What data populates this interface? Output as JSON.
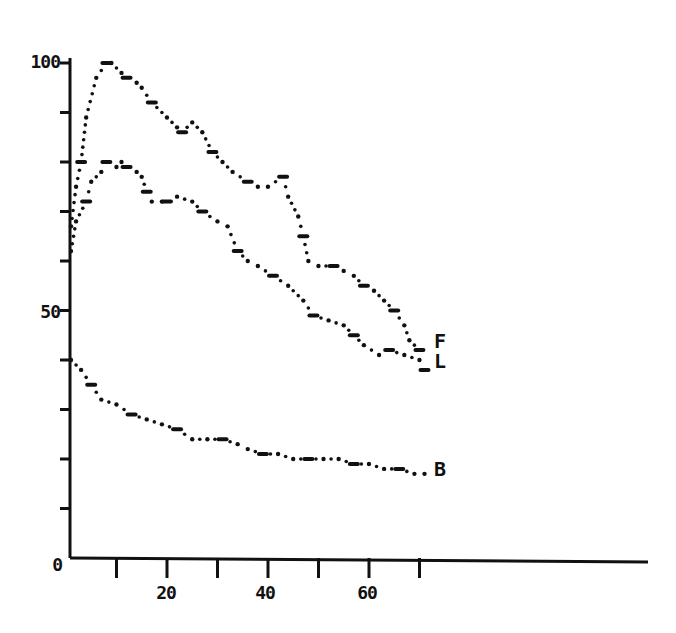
{
  "chart_data": {
    "type": "line",
    "title": "",
    "xlabel": "",
    "ylabel": "",
    "xlim": [
      0,
      115
    ],
    "ylim": [
      0,
      100
    ],
    "grid": false,
    "legend": "end-of-line labels",
    "y_ticks": [
      0,
      10,
      20,
      30,
      40,
      50,
      60,
      70,
      80,
      90,
      100
    ],
    "y_tick_labels": [
      {
        "value": 0,
        "label": "0"
      },
      {
        "value": 50,
        "label": "50"
      },
      {
        "value": 100,
        "label": "100"
      }
    ],
    "x_ticks": [
      10,
      20,
      30,
      40,
      50,
      60,
      70
    ],
    "x_tick_labels": [
      {
        "value": 20,
        "label": "20"
      },
      {
        "value": 40,
        "label": "40"
      },
      {
        "value": 60,
        "label": "60"
      }
    ],
    "series": [
      {
        "name": "F",
        "style": "dotted",
        "x": [
          1,
          2,
          3,
          4,
          6,
          8,
          9,
          11,
          12,
          14,
          15,
          17,
          20,
          22,
          23,
          25,
          27,
          29,
          31,
          33,
          36,
          38,
          40,
          43,
          44,
          46,
          47,
          48,
          50,
          53,
          55,
          57,
          59,
          61,
          63,
          65,
          67,
          68,
          70
        ],
        "values": [
          67,
          75,
          80,
          89,
          97,
          100,
          100,
          98,
          97,
          96,
          95,
          92,
          89,
          87,
          86,
          88,
          86,
          82,
          80,
          78,
          76,
          75,
          75,
          77,
          73,
          69,
          65,
          60,
          59,
          59,
          58,
          57,
          55,
          54,
          52,
          50,
          47,
          44,
          42
        ]
      },
      {
        "name": "L",
        "style": "dotted",
        "x": [
          1,
          2,
          4,
          5,
          7,
          8,
          10,
          11,
          12,
          14,
          15,
          16,
          17,
          19,
          20,
          22,
          25,
          27,
          30,
          32,
          34,
          36,
          38,
          41,
          44,
          47,
          49,
          52,
          55,
          57,
          59,
          62,
          64,
          67,
          70,
          71
        ],
        "values": [
          62,
          68,
          72,
          76,
          78,
          80,
          79,
          80,
          79,
          78,
          77,
          74,
          72,
          72,
          72,
          73,
          72,
          70,
          68,
          67,
          62,
          60,
          59,
          57,
          55,
          52,
          49,
          48,
          47,
          45,
          43,
          41,
          42,
          41,
          40,
          38
        ]
      },
      {
        "name": "B",
        "style": "dotted",
        "x": [
          1,
          3,
          5,
          7,
          10,
          13,
          16,
          19,
          22,
          25,
          28,
          31,
          34,
          36,
          39,
          42,
          45,
          48,
          51,
          54,
          57,
          60,
          63,
          66,
          69,
          71
        ],
        "values": [
          40,
          38,
          35,
          32,
          31,
          29,
          28,
          27,
          26,
          24,
          24,
          24,
          23,
          22,
          21,
          21,
          20,
          20,
          20,
          20,
          19,
          19,
          18,
          18,
          17,
          17
        ]
      }
    ]
  },
  "axis_labels": {
    "y_top": "100",
    "y_mid": "50",
    "origin": "0",
    "x_20": "20",
    "x_40": "40",
    "x_60": "60"
  },
  "end_labels": {
    "top": "F",
    "middle": "L",
    "bottom": "B"
  },
  "colors": {
    "ink": "#111111",
    "background": "#ffffff"
  }
}
